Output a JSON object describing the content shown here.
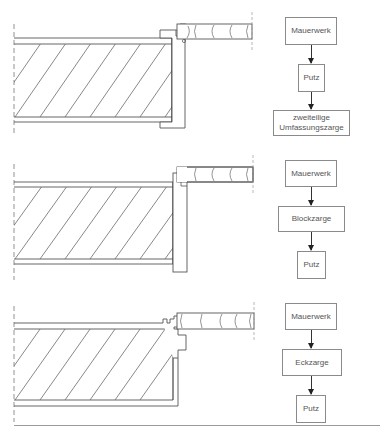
{
  "diagrams": [
    {
      "id": "umfassungszarge",
      "drawing_label": "Wall section with two-part wrap-around door frame (zweiteilige Umfassungszarge)",
      "flow": [
        "Mauerwerk",
        "Putz",
        "zweiteilige Umfassungszarge"
      ]
    },
    {
      "id": "blockzarge",
      "drawing_label": "Wall section with block frame (Blockzarge)",
      "flow": [
        "Mauerwerk",
        "Blockzarge",
        "Putz"
      ]
    },
    {
      "id": "eckzarge",
      "drawing_label": "Wall section with corner frame (Eckzarge)",
      "flow": [
        "Mauerwerk",
        "Eckzarge",
        "Putz"
      ]
    }
  ],
  "colors": {
    "line": "#555555",
    "hatch": "#6a6a6a",
    "box_border": "#8a8a8a",
    "text": "#555555",
    "rule": "#9a9a9a"
  }
}
